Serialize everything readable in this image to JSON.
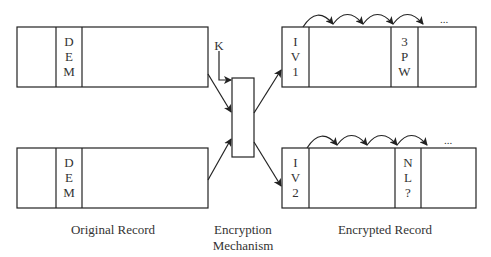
{
  "original_records": [
    {
      "field": [
        "D",
        "E",
        "M"
      ]
    },
    {
      "field": [
        "D",
        "E",
        "M"
      ]
    }
  ],
  "encryption": {
    "key_label": "K"
  },
  "encrypted_records": [
    {
      "iv": [
        "I",
        "V",
        "1"
      ],
      "marked_field": [
        "3",
        "P",
        "W"
      ],
      "ellipsis": "..."
    },
    {
      "iv": [
        "I",
        "V",
        "2"
      ],
      "marked_field": [
        "N",
        "L",
        "?"
      ],
      "ellipsis": "..."
    }
  ],
  "labels": {
    "original": "Original Record",
    "mechanism_line1": "Encryption",
    "mechanism_line2": "Mechanism",
    "encrypted": "Encrypted Record"
  }
}
